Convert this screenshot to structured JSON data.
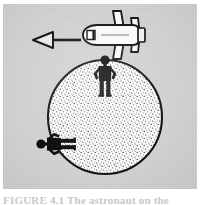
{
  "figure": {
    "background_color": "#d4d4d4",
    "ink_color": "#1a1a1a",
    "fill_color": "#f2f2f2",
    "caption": "FIGURE 4.1 The astronaut on the",
    "alt_description": "A stippled sphere representing a planet, with a person standing upright at the top pole and another person standing sideways at the left edge; above, an airplane seen from above with a leftward arrow showing its direction of travel.",
    "elements": [
      {
        "name": "airplane",
        "label": "airplane",
        "description": "Top-view airplane outline with nose pointing left, cockpit window marked",
        "position": {
          "x": 108,
          "y": 33
        },
        "heading": "left"
      },
      {
        "name": "motion-arrow",
        "label": "motion arrow",
        "description": "Hollow triangular arrowhead pointing left with a solid shaft, indicating direction of travel",
        "direction": "left",
        "from": {
          "x": 96,
          "y": 38
        },
        "to": {
          "x": 47,
          "y": 38
        }
      },
      {
        "name": "planet",
        "label": "planet",
        "description": "Large stippled circle representing a planet or spherical world",
        "center": {
          "x": 105,
          "y": 117
        },
        "radius": 58
      },
      {
        "name": "person-top",
        "label": "person standing at top",
        "description": "Black silhouette standing upright with hands on hips at the top of the sphere",
        "position": {
          "x": 106,
          "y": 75
        },
        "orientation": "upright"
      },
      {
        "name": "person-left",
        "label": "person standing at left",
        "description": "Black silhouette standing on the left side of the sphere, rotated ninety degrees so that feet point toward the centre",
        "position": {
          "x": 38,
          "y": 142
        },
        "orientation": "rotated-90"
      }
    ]
  }
}
